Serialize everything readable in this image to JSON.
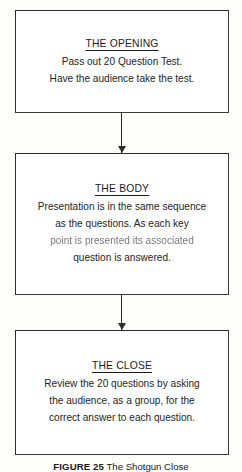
{
  "figure": {
    "nodes": [
      {
        "title": "THE OPENING",
        "lines": [
          "Pass out 20 Question Test.",
          "Have the audience take the test."
        ]
      },
      {
        "title": "THE BODY",
        "lines": [
          "Presentation is in the same sequence",
          "as the questions. As each key",
          "point is presented its associated",
          "question is answered."
        ]
      },
      {
        "title": "THE CLOSE",
        "lines": [
          "Review the 20 questions by asking",
          "the audience, as a group, for the",
          "correct answer to each question."
        ]
      }
    ],
    "caption": {
      "label": "FIGURE 25",
      "text": "The Shotgun Close"
    },
    "colors": {
      "border": "#2b2b2b",
      "text": "#1e1e1e",
      "background": "#fdfdfc",
      "arrow": "#2e2e2e"
    }
  }
}
